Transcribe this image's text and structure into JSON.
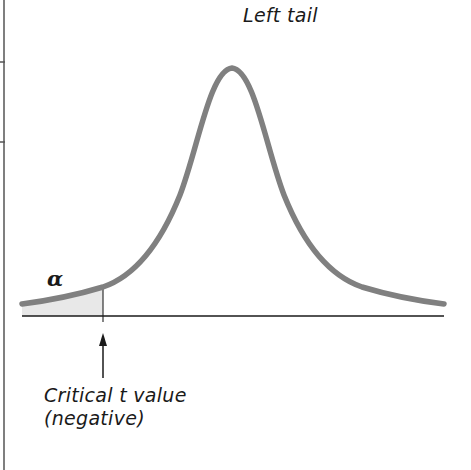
{
  "diagram": {
    "title": "Left tail",
    "alpha_symbol": "α",
    "critical_label_line1": "Critical t value",
    "critical_label_line2": "(negative)",
    "colors": {
      "curve": "#808080",
      "shade": "#e6e6e6",
      "axis": "#1a1a1a",
      "frame": "#555555"
    }
  }
}
